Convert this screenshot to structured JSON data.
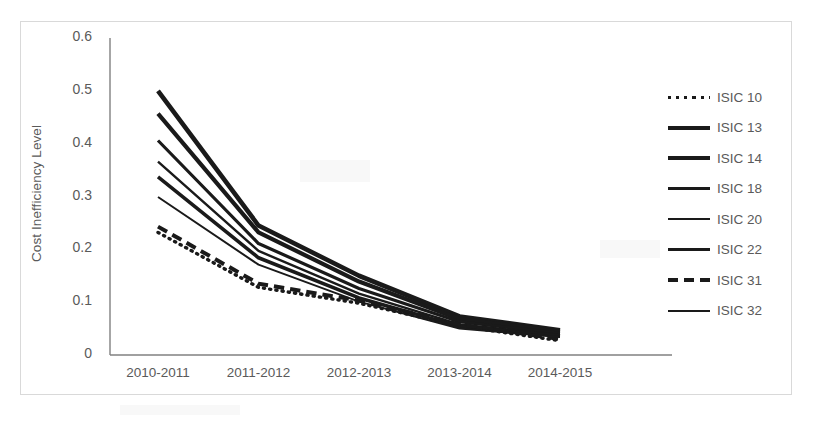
{
  "chart_data": {
    "type": "line",
    "title": "",
    "subtitle": "",
    "xlabel": "",
    "ylabel": "Cost Inefficiency Level",
    "categories": [
      "2010-2011",
      "2011-2012",
      "2012-2013",
      "2013-2014",
      "2014-2015"
    ],
    "ylim": [
      0,
      0.6
    ],
    "xlim": [
      0,
      4
    ],
    "ytick_labels": [
      "0",
      "0.1",
      "0.2",
      "0.3",
      "0.4",
      "0.5",
      "0.6"
    ],
    "ytick_values": [
      0,
      0.1,
      0.2,
      0.3,
      0.4,
      0.5,
      0.6
    ],
    "grid": false,
    "legend_position": "right",
    "line_color": "#1a1a1a",
    "axis_color": "#808080",
    "text_color": "#5a5a5a",
    "series": [
      {
        "name": "ISIC 10",
        "values": [
          0.232,
          0.128,
          0.098,
          0.055,
          0.027
        ],
        "style": "dotted",
        "width": 3.4
      },
      {
        "name": "ISIC 13",
        "values": [
          0.5,
          0.245,
          0.15,
          0.073,
          0.047
        ],
        "style": "solid",
        "width": 4.6
      },
      {
        "name": "ISIC 14",
        "values": [
          0.457,
          0.232,
          0.139,
          0.068,
          0.044
        ],
        "style": "solid",
        "width": 4.2
      },
      {
        "name": "ISIC 18",
        "values": [
          0.406,
          0.211,
          0.126,
          0.063,
          0.041
        ],
        "style": "solid",
        "width": 3.2
      },
      {
        "name": "ISIC 20",
        "values": [
          0.366,
          0.197,
          0.116,
          0.058,
          0.038
        ],
        "style": "solid",
        "width": 2.4
      },
      {
        "name": "ISIC 22",
        "values": [
          0.337,
          0.184,
          0.108,
          0.054,
          0.036
        ],
        "style": "solid",
        "width": 3.6
      },
      {
        "name": "ISIC 31",
        "values": [
          0.243,
          0.135,
          0.103,
          0.058,
          0.03
        ],
        "style": "dashed",
        "width": 4.0
      },
      {
        "name": "ISIC 32",
        "values": [
          0.299,
          0.171,
          0.101,
          0.05,
          0.034
        ],
        "style": "solid",
        "width": 2.0
      }
    ]
  },
  "axis": {
    "y_title": "Cost Inefficiency Level"
  }
}
